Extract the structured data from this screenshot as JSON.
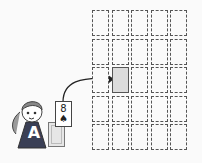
{
  "diagram": {
    "grid": {
      "rows": 5,
      "cols": 5,
      "highlighted": {
        "row": 2,
        "col": 1
      }
    },
    "player": {
      "label": "A"
    },
    "card": {
      "rank": "8",
      "suit": "♠"
    },
    "arrow": {
      "from": "card",
      "to": "highlighted-cell"
    }
  }
}
